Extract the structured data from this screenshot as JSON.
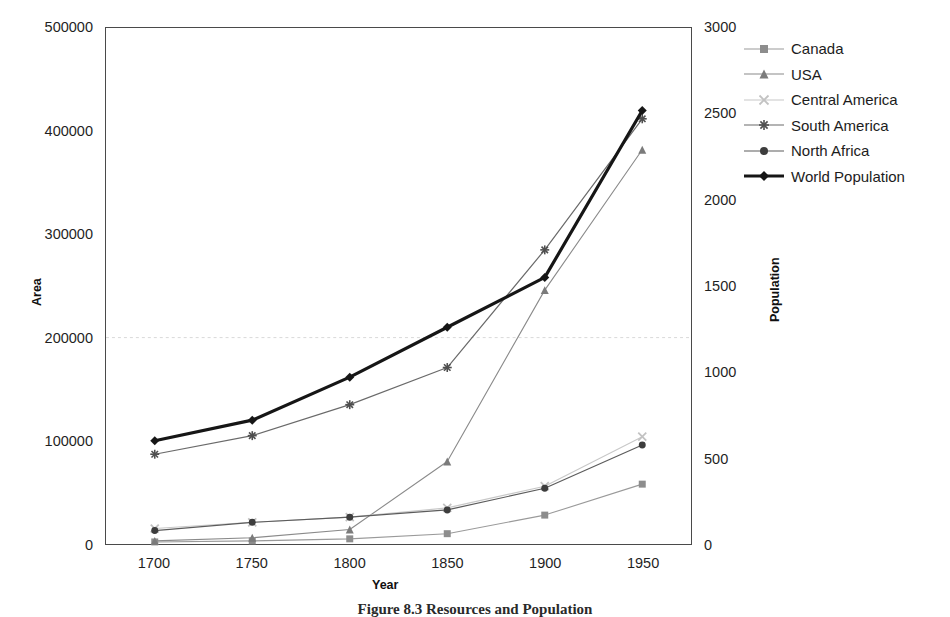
{
  "chart_data": {
    "type": "line",
    "title": "",
    "xlabel": "Year",
    "ylabel": "Area",
    "y2label": "Population",
    "x": [
      1700,
      1750,
      1800,
      1850,
      1900,
      1950
    ],
    "xticklabels": [
      "1700",
      "1750",
      "1800",
      "1850",
      "1900",
      "1950"
    ],
    "xlim": [
      1675,
      1975
    ],
    "ylim": [
      0,
      500000
    ],
    "yticks": [
      0,
      100000,
      200000,
      300000,
      400000,
      500000
    ],
    "yticklabels": [
      "0",
      "100000",
      "200000",
      "300000",
      "400000",
      "500000"
    ],
    "y2lim": [
      0,
      3000
    ],
    "y2ticks": [
      0,
      500,
      1000,
      1500,
      2000,
      2500,
      3000
    ],
    "y2ticklabels": [
      "0",
      "500",
      "1000",
      "1500",
      "2000",
      "2500",
      "3000"
    ],
    "grid": "horizontal-dashed-faint-at-200000",
    "legend_position": "right",
    "series": [
      {
        "name": "Canada",
        "axis": "left",
        "marker": "square",
        "color": "#8d8d8d",
        "line_color": "#9a9a9a",
        "line_width": 1.1,
        "marker_size": 7,
        "values": [
          2000,
          3000,
          5000,
          10000,
          28000,
          58000
        ]
      },
      {
        "name": "USA",
        "axis": "left",
        "marker": "triangle",
        "color": "#7b7b7b",
        "line_color": "#8a8a8a",
        "line_width": 1.1,
        "marker_size": 8,
        "values": [
          3000,
          6000,
          14000,
          80000,
          246000,
          382000
        ]
      },
      {
        "name": "Central America",
        "axis": "left",
        "marker": "cross",
        "color": "#c2c2c2",
        "line_color": "#c8c8c8",
        "line_width": 1.1,
        "marker_size": 8,
        "values": [
          15000,
          21000,
          26000,
          35000,
          56000,
          104000
        ]
      },
      {
        "name": "South America",
        "axis": "left",
        "marker": "asterisk",
        "color": "#4f4f4f",
        "line_color": "#6a6a6a",
        "line_width": 1.2,
        "marker_size": 9,
        "values": [
          87000,
          105000,
          135000,
          171000,
          285000,
          412000
        ]
      },
      {
        "name": "North Africa",
        "axis": "left",
        "marker": "circle",
        "color": "#3d3d3d",
        "line_color": "#5c5c5c",
        "line_width": 1.2,
        "marker_size": 7,
        "values": [
          13000,
          21000,
          26000,
          33000,
          54000,
          96000
        ]
      },
      {
        "name": "World Population",
        "axis": "right",
        "marker": "diamond",
        "color": "#161616",
        "line_color": "#161616",
        "line_width": 3.2,
        "marker_size": 9,
        "values": [
          600,
          720,
          970,
          1260,
          1550,
          2520
        ]
      }
    ]
  },
  "caption": {
    "text": "Figure 8.3  Resources and Population"
  }
}
